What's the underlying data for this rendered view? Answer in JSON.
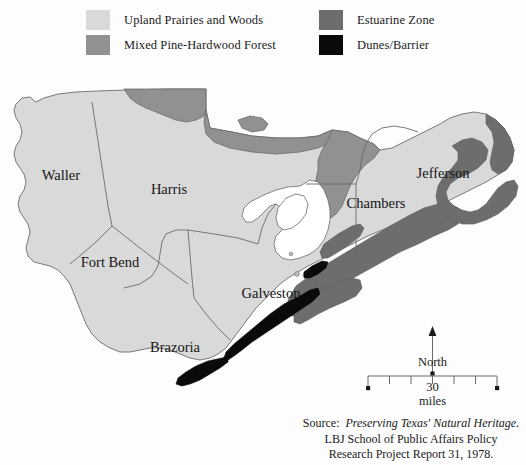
{
  "legend": {
    "entries": [
      {
        "label": "Upland Prairies and Woods",
        "color": "#d9d9d9",
        "name": "legend-upland-prairies-and-woods"
      },
      {
        "label": "Mixed Pine-Hardwood Forest",
        "color": "#919191",
        "name": "legend-mixed-pine-hardwood-forest"
      },
      {
        "label": "Estuarine Zone",
        "color": "#6d6d6d",
        "name": "legend-estuarine-zone"
      },
      {
        "label": "Dunes/Barrier",
        "color": "#0a0a0a",
        "name": "legend-dunes-barrier"
      }
    ]
  },
  "map": {
    "counties": [
      {
        "label": "Waller",
        "x": 61,
        "y": 122
      },
      {
        "label": "Harris",
        "x": 169,
        "y": 136
      },
      {
        "label": "Fort Bend",
        "x": 110,
        "y": 209
      },
      {
        "label": "Brazoria",
        "x": 175,
        "y": 294
      },
      {
        "label": "Galveston",
        "x": 271,
        "y": 240
      },
      {
        "label": "Chambers",
        "x": 376,
        "y": 150
      },
      {
        "label": "Jefferson",
        "x": 443,
        "y": 120
      }
    ],
    "colors": {
      "upland": "#d9d9d9",
      "forest": "#919191",
      "estuarine": "#6d6d6d",
      "dunes": "#0a0a0a",
      "water": "#ffffff",
      "outline": "#6b6b6b",
      "background": "#fdfdfd"
    }
  },
  "compass": {
    "north_label": "North"
  },
  "scale": {
    "value_label": "30",
    "unit_label": "miles",
    "segments": 6
  },
  "source": {
    "line1_prefix": "Source:",
    "line1_title": "Preserving Texas' Natural Heritage.",
    "line2": "LBJ School of Public Affairs Policy",
    "line3": "Research Project Report 31, 1978."
  }
}
